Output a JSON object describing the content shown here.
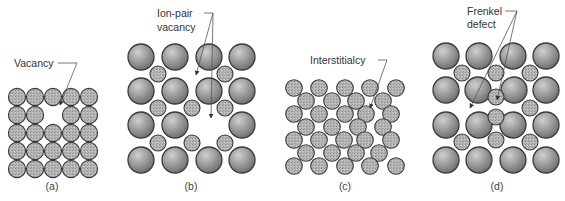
{
  "figure": {
    "panels": [
      {
        "id": "a",
        "caption": "(a)",
        "annotation": [
          "Vacancy"
        ],
        "description": "5x5 lattice of identical atoms with one missing atom"
      },
      {
        "id": "b",
        "caption": "(b)",
        "annotation": [
          "Ion-pair",
          "vacancy"
        ],
        "description": "Ionic lattice of large and small ions with one large and one small ion missing"
      },
      {
        "id": "c",
        "caption": "(c)",
        "annotation": [
          "Interstitialcy"
        ],
        "description": "Close-packed lattice with an extra atom squeezed into an interstitial site"
      },
      {
        "id": "d",
        "caption": "(d)",
        "annotation": [
          "Frenkel",
          "defect"
        ],
        "description": "Ionic lattice where a small ion has moved from its site to an interstitial position"
      }
    ],
    "colors": {
      "large_ion_light": "#c4c4c4",
      "large_ion_dark": "#7e7e7e",
      "small_ion": "#b3b3b3",
      "outline": "#3a3a3a",
      "leader_line": "#555555"
    }
  }
}
